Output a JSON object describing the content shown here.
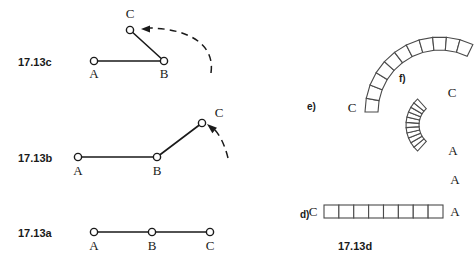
{
  "figure": {
    "title": "17.13",
    "background_color": "#ffffff",
    "ink_color": "#1a1a1a"
  },
  "panels": {
    "c": {
      "caption": "17.13c",
      "caption_pos": {
        "x": 18,
        "y": 66
      },
      "joints": [
        {
          "name": "A",
          "x": 94,
          "y": 61,
          "label": "A",
          "label_x": 94,
          "label_y": 78
        },
        {
          "name": "B",
          "x": 164,
          "y": 61,
          "label": "B",
          "label_x": 164,
          "label_y": 78
        },
        {
          "name": "C",
          "x": 130,
          "y": 30,
          "label": "C",
          "label_x": 130,
          "label_y": 18
        }
      ],
      "links": [
        {
          "from": "A",
          "to": "B"
        },
        {
          "from": "B",
          "to": "C"
        }
      ],
      "motion_arrow": {
        "path": "M 211 73 C 215 45 190 29 150 28",
        "arrow_tip": {
          "x": 141,
          "y": 29
        },
        "direction": "left"
      }
    },
    "b": {
      "caption": "17.13b",
      "caption_pos": {
        "x": 18,
        "y": 162
      },
      "joints": [
        {
          "name": "A",
          "x": 78,
          "y": 157,
          "label": "A",
          "label_x": 78,
          "label_y": 175
        },
        {
          "name": "B",
          "x": 157,
          "y": 157,
          "label": "B",
          "label_x": 157,
          "label_y": 175
        },
        {
          "name": "C",
          "x": 202,
          "y": 123,
          "label": "C",
          "label_x": 219,
          "label_y": 117
        }
      ],
      "links": [
        {
          "from": "A",
          "to": "B"
        },
        {
          "from": "B",
          "to": "C"
        }
      ],
      "motion_arrow": {
        "path": "M 228 158 C 224 142 218 132 212 127",
        "arrow_tip": {
          "x": 207,
          "y": 124
        },
        "direction": "upleft"
      }
    },
    "a": {
      "caption": "17.13a",
      "caption_pos": {
        "x": 18,
        "y": 237
      },
      "joints": [
        {
          "name": "A",
          "x": 94,
          "y": 232,
          "label": "A",
          "label_x": 94,
          "label_y": 250
        },
        {
          "name": "B",
          "x": 152,
          "y": 232,
          "label": "B",
          "label_x": 152,
          "label_y": 250
        },
        {
          "name": "C",
          "x": 210,
          "y": 232,
          "label": "C",
          "label_x": 210,
          "label_y": 250
        }
      ],
      "links": [
        {
          "from": "A",
          "to": "B"
        },
        {
          "from": "B",
          "to": "C"
        }
      ],
      "motion_arrow": null
    },
    "d": {
      "sub_caption": "d)",
      "sub_caption_pos": {
        "x": 300,
        "y": 218
      },
      "caption": "17.13d",
      "caption_pos": {
        "x": 355,
        "y": 250
      },
      "shape": "straight-bar",
      "segments": 8,
      "bar": {
        "x": 324,
        "y": 205,
        "width": 119,
        "height": 13
      },
      "end_labels": [
        {
          "text": "C",
          "x": 313,
          "y": 216
        },
        {
          "text": "A",
          "x": 455,
          "y": 216
        }
      ]
    },
    "e": {
      "sub_caption": "e)",
      "sub_caption_pos": {
        "x": 307,
        "y": 110
      },
      "shape": "gentle-arc",
      "segments": 11,
      "arc": {
        "center_x": 440,
        "center_y": 112,
        "inner_radius": 62,
        "outer_radius": 75,
        "start_angle_deg": 180,
        "end_angle_deg": 64
      },
      "end_labels": [
        {
          "text": "C",
          "x": 352,
          "y": 112
        },
        {
          "text": "A",
          "x": 455,
          "y": 184
        }
      ]
    },
    "f": {
      "sub_caption": "f)",
      "sub_caption_pos": {
        "x": 399,
        "y": 82
      },
      "shape": "tight-arc",
      "segments": 11,
      "arc": {
        "center_x": 441,
        "center_y": 125,
        "inner_radius": 22,
        "outer_radius": 35,
        "start_angle_deg": 228,
        "end_angle_deg": 132
      },
      "end_labels": [
        {
          "text": "C",
          "x": 452,
          "y": 97
        },
        {
          "text": "A",
          "x": 453,
          "y": 155
        }
      ]
    }
  }
}
